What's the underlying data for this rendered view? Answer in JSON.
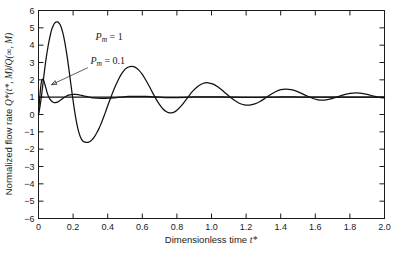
{
  "chart_data": {
    "type": "line",
    "title": "",
    "xlabel": "Dimensionless time t*",
    "ylabel": "Normalized flow rate Q*(t*, M)/Q(∞, M)",
    "xlim": [
      0,
      2.0
    ],
    "ylim": [
      -6,
      6
    ],
    "grid": false,
    "legend_position": "inside-annotations",
    "xticks": [
      0,
      0.2,
      0.4,
      0.6,
      0.8,
      1.0,
      1.2,
      1.4,
      1.6,
      1.8,
      2.0
    ],
    "xtick_labels": [
      "0",
      "0.2",
      "0.4",
      "0.6",
      "0.8",
      "1.0",
      "1.2",
      "1.4",
      "1.6",
      "1.8",
      "2.0"
    ],
    "yticks": [
      -6,
      -5,
      -4,
      -3,
      -2,
      -1,
      0,
      1,
      2,
      3,
      4,
      5,
      6
    ],
    "ytick_labels": [
      "−6",
      "−5",
      "−4",
      "−3",
      "−2",
      "−1",
      "0",
      "1",
      "2",
      "3",
      "4",
      "5",
      "6"
    ],
    "annotations": [
      {
        "name": "pm-1-label",
        "base": "P",
        "sub": "m",
        "rest": " = 1",
        "x": 0.33,
        "y": 4.28
      },
      {
        "name": "pm-01-label",
        "base": "P",
        "sub": "m",
        "rest": " = 0.1",
        "x": 0.3,
        "y": 2.92
      }
    ],
    "leader": {
      "from_x": 0.285,
      "from_y": 2.7,
      "to_x": 0.075,
      "to_y": 1.72
    },
    "asymptote": {
      "value": 1.0,
      "from_x": 0.0,
      "to_x": 2.0
    },
    "series": [
      {
        "name": "P_m = 1",
        "color": "#111111",
        "points": [
          [
            0.0,
            0.0
          ],
          [
            0.005,
            0.25
          ],
          [
            0.01,
            0.55
          ],
          [
            0.015,
            0.9
          ],
          [
            0.02,
            1.3
          ],
          [
            0.025,
            1.72
          ],
          [
            0.03,
            2.14
          ],
          [
            0.035,
            2.55
          ],
          [
            0.04,
            2.94
          ],
          [
            0.045,
            3.3
          ],
          [
            0.05,
            3.62
          ],
          [
            0.055,
            3.92
          ],
          [
            0.06,
            4.19
          ],
          [
            0.065,
            4.44
          ],
          [
            0.07,
            4.66
          ],
          [
            0.075,
            4.85
          ],
          [
            0.08,
            5.0
          ],
          [
            0.085,
            5.12
          ],
          [
            0.09,
            5.22
          ],
          [
            0.095,
            5.29
          ],
          [
            0.1,
            5.33
          ],
          [
            0.105,
            5.35
          ],
          [
            0.11,
            5.34
          ],
          [
            0.115,
            5.31
          ],
          [
            0.12,
            5.26
          ],
          [
            0.125,
            5.18
          ],
          [
            0.13,
            5.06
          ],
          [
            0.135,
            4.92
          ],
          [
            0.14,
            4.74
          ],
          [
            0.145,
            4.53
          ],
          [
            0.15,
            4.28
          ],
          [
            0.155,
            4.0
          ],
          [
            0.16,
            3.7
          ],
          [
            0.165,
            3.38
          ],
          [
            0.17,
            3.04
          ],
          [
            0.175,
            2.68
          ],
          [
            0.18,
            2.3
          ],
          [
            0.185,
            1.92
          ],
          [
            0.19,
            1.54
          ],
          [
            0.195,
            1.16
          ],
          [
            0.2,
            0.8
          ],
          [
            0.21,
            0.12
          ],
          [
            0.22,
            -0.46
          ],
          [
            0.23,
            -0.92
          ],
          [
            0.24,
            -1.24
          ],
          [
            0.25,
            -1.45
          ],
          [
            0.26,
            -1.56
          ],
          [
            0.27,
            -1.6
          ],
          [
            0.28,
            -1.61
          ],
          [
            0.29,
            -1.59
          ],
          [
            0.3,
            -1.54
          ],
          [
            0.31,
            -1.45
          ],
          [
            0.32,
            -1.33
          ],
          [
            0.33,
            -1.18
          ],
          [
            0.34,
            -1.0
          ],
          [
            0.35,
            -0.8
          ],
          [
            0.36,
            -0.57
          ],
          [
            0.37,
            -0.32
          ],
          [
            0.38,
            -0.06
          ],
          [
            0.39,
            0.22
          ],
          [
            0.4,
            0.5
          ],
          [
            0.42,
            1.04
          ],
          [
            0.44,
            1.54
          ],
          [
            0.46,
            1.98
          ],
          [
            0.48,
            2.34
          ],
          [
            0.5,
            2.6
          ],
          [
            0.52,
            2.74
          ],
          [
            0.54,
            2.78
          ],
          [
            0.56,
            2.72
          ],
          [
            0.58,
            2.56
          ],
          [
            0.6,
            2.31
          ],
          [
            0.62,
            1.99
          ],
          [
            0.64,
            1.63
          ],
          [
            0.66,
            1.25
          ],
          [
            0.68,
            0.89
          ],
          [
            0.7,
            0.57
          ],
          [
            0.72,
            0.32
          ],
          [
            0.74,
            0.16
          ],
          [
            0.76,
            0.09
          ],
          [
            0.78,
            0.12
          ],
          [
            0.8,
            0.25
          ],
          [
            0.83,
            0.56
          ],
          [
            0.86,
            0.95
          ],
          [
            0.89,
            1.33
          ],
          [
            0.92,
            1.62
          ],
          [
            0.95,
            1.79
          ],
          [
            0.98,
            1.83
          ],
          [
            1.01,
            1.75
          ],
          [
            1.04,
            1.57
          ],
          [
            1.07,
            1.33
          ],
          [
            1.1,
            1.07
          ],
          [
            1.13,
            0.83
          ],
          [
            1.16,
            0.65
          ],
          [
            1.19,
            0.55
          ],
          [
            1.22,
            0.54
          ],
          [
            1.25,
            0.61
          ],
          [
            1.28,
            0.75
          ],
          [
            1.31,
            0.94
          ],
          [
            1.34,
            1.14
          ],
          [
            1.37,
            1.31
          ],
          [
            1.4,
            1.43
          ],
          [
            1.43,
            1.47
          ],
          [
            1.46,
            1.44
          ],
          [
            1.49,
            1.35
          ],
          [
            1.52,
            1.22
          ],
          [
            1.55,
            1.08
          ],
          [
            1.58,
            0.95
          ],
          [
            1.61,
            0.86
          ],
          [
            1.64,
            0.83
          ],
          [
            1.67,
            0.86
          ],
          [
            1.7,
            0.93
          ],
          [
            1.74,
            1.06
          ],
          [
            1.78,
            1.18
          ],
          [
            1.82,
            1.24
          ],
          [
            1.86,
            1.23
          ],
          [
            1.9,
            1.16
          ],
          [
            1.94,
            1.06
          ],
          [
            1.97,
            0.99
          ],
          [
            2.0,
            0.96
          ]
        ]
      },
      {
        "name": "P_m = 0.1",
        "color": "#111111",
        "points": [
          [
            0.0,
            0.0
          ],
          [
            0.003,
            0.42
          ],
          [
            0.006,
            0.84
          ],
          [
            0.009,
            1.2
          ],
          [
            0.012,
            1.52
          ],
          [
            0.015,
            1.76
          ],
          [
            0.018,
            1.92
          ],
          [
            0.021,
            2.01
          ],
          [
            0.024,
            2.04
          ],
          [
            0.027,
            2.02
          ],
          [
            0.03,
            1.96
          ],
          [
            0.034,
            1.84
          ],
          [
            0.038,
            1.7
          ],
          [
            0.042,
            1.55
          ],
          [
            0.046,
            1.4
          ],
          [
            0.05,
            1.26
          ],
          [
            0.056,
            1.09
          ],
          [
            0.062,
            0.96
          ],
          [
            0.068,
            0.86
          ],
          [
            0.074,
            0.79
          ],
          [
            0.08,
            0.74
          ],
          [
            0.088,
            0.7
          ],
          [
            0.096,
            0.69
          ],
          [
            0.104,
            0.7
          ],
          [
            0.112,
            0.73
          ],
          [
            0.12,
            0.78
          ],
          [
            0.13,
            0.85
          ],
          [
            0.14,
            0.92
          ],
          [
            0.15,
            0.99
          ],
          [
            0.16,
            1.05
          ],
          [
            0.17,
            1.1
          ],
          [
            0.18,
            1.13
          ],
          [
            0.19,
            1.15
          ],
          [
            0.2,
            1.16
          ],
          [
            0.215,
            1.16
          ],
          [
            0.23,
            1.14
          ],
          [
            0.245,
            1.11
          ],
          [
            0.26,
            1.08
          ],
          [
            0.275,
            1.04
          ],
          [
            0.29,
            1.01
          ],
          [
            0.305,
            0.98
          ],
          [
            0.32,
            0.96
          ],
          [
            0.34,
            0.94
          ],
          [
            0.36,
            0.93
          ],
          [
            0.38,
            0.93
          ],
          [
            0.4,
            0.94
          ],
          [
            0.43,
            0.96
          ],
          [
            0.46,
            0.99
          ],
          [
            0.49,
            1.02
          ],
          [
            0.52,
            1.04
          ],
          [
            0.55,
            1.05
          ],
          [
            0.58,
            1.05
          ],
          [
            0.62,
            1.04
          ],
          [
            0.66,
            1.02
          ],
          [
            0.7,
            1.0
          ],
          [
            0.75,
            0.98
          ],
          [
            0.8,
            0.98
          ],
          [
            0.85,
            0.99
          ],
          [
            0.9,
            1.01
          ],
          [
            0.95,
            1.02
          ],
          [
            1.0,
            1.02
          ],
          [
            1.06,
            1.01
          ],
          [
            1.12,
            1.0
          ],
          [
            1.18,
            0.99
          ],
          [
            1.25,
            0.99
          ],
          [
            1.32,
            1.0
          ],
          [
            1.4,
            1.01
          ],
          [
            1.48,
            1.01
          ],
          [
            1.56,
            1.0
          ],
          [
            1.65,
            1.0
          ],
          [
            1.75,
            1.0
          ],
          [
            1.85,
            1.0
          ],
          [
            2.0,
            1.0
          ]
        ]
      }
    ]
  },
  "axes": {
    "ylabel_text": "Normalized flow rate",
    "ylabel_math_q1": "Q*(t*, M)",
    "ylabel_slash": "/",
    "ylabel_math_q2": "Q(∞, M)",
    "xlabel_text": "Dimensionless time",
    "xlabel_math": "t*"
  }
}
